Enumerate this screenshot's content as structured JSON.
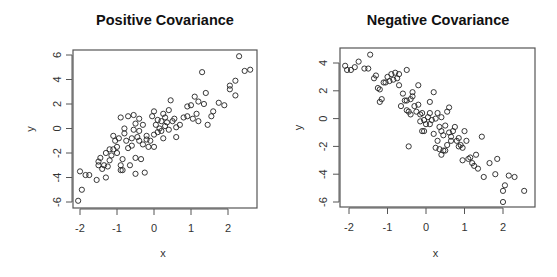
{
  "chart_data": [
    {
      "type": "scatter",
      "title": "Positive Covariance",
      "xlabel": "x",
      "ylabel": "y",
      "xlim": [
        -2.1,
        2.7
      ],
      "ylim": [
        -6.3,
        6.3
      ],
      "x_ticks": [
        -2,
        -1,
        0,
        1,
        2
      ],
      "y_ticks": [
        -6,
        -4,
        -2,
        0,
        2,
        4,
        6
      ],
      "grid": false,
      "legend": null,
      "marker": "open-circle",
      "points": [
        [
          -2.05,
          -5.9
        ],
        [
          -1.95,
          -5.0
        ],
        [
          -2.0,
          -3.5
        ],
        [
          -1.85,
          -3.8
        ],
        [
          -1.75,
          -3.8
        ],
        [
          -1.55,
          -4.2
        ],
        [
          -1.5,
          -3.0
        ],
        [
          -1.45,
          -2.4
        ],
        [
          -1.4,
          -3.3
        ],
        [
          -1.35,
          -3.0
        ],
        [
          -1.3,
          -2.0
        ],
        [
          -1.3,
          -4.0
        ],
        [
          -1.25,
          -3.1
        ],
        [
          -1.2,
          -2.6
        ],
        [
          -1.2,
          -1.7
        ],
        [
          -1.15,
          -2.2
        ],
        [
          -1.1,
          -1.7
        ],
        [
          -1.05,
          -1.0
        ],
        [
          -1.1,
          -0.6
        ],
        [
          -1.0,
          -1.5
        ],
        [
          -0.95,
          -0.8
        ],
        [
          -0.9,
          -3.4
        ],
        [
          -0.9,
          -3.0
        ],
        [
          -0.85,
          -3.4
        ],
        [
          -0.85,
          -2.5
        ],
        [
          -0.8,
          -0.4
        ],
        [
          -0.8,
          0.0
        ],
        [
          -0.75,
          -1.0
        ],
        [
          -0.7,
          -1.6
        ],
        [
          -0.65,
          -3.0
        ],
        [
          -0.6,
          -0.8
        ],
        [
          -0.55,
          -0.1
        ],
        [
          -0.5,
          -3.7
        ],
        [
          -0.5,
          -2.4
        ],
        [
          -0.5,
          0.4
        ],
        [
          -0.45,
          -0.7
        ],
        [
          -0.4,
          -0.2
        ],
        [
          -0.4,
          -1.0
        ],
        [
          -0.35,
          -2.5
        ],
        [
          -0.3,
          -1.3
        ],
        [
          -0.25,
          -3.6
        ],
        [
          -0.2,
          -0.9
        ],
        [
          -0.15,
          -1.5
        ],
        [
          -0.1,
          -1.0
        ],
        [
          -0.05,
          1.0
        ],
        [
          0.0,
          -0.5
        ],
        [
          0.0,
          -1.5
        ],
        [
          0.05,
          0.3
        ],
        [
          0.1,
          0.7
        ],
        [
          0.1,
          -0.3
        ],
        [
          0.15,
          0.0
        ],
        [
          0.2,
          0.6
        ],
        [
          0.2,
          -0.2
        ],
        [
          0.25,
          1.2
        ],
        [
          0.3,
          0.9
        ],
        [
          0.3,
          0.2
        ],
        [
          0.35,
          0.5
        ],
        [
          0.4,
          -0.1
        ],
        [
          0.4,
          1.5
        ],
        [
          0.45,
          2.3
        ],
        [
          0.5,
          0.6
        ],
        [
          0.55,
          0.8
        ],
        [
          0.6,
          0.1
        ],
        [
          0.6,
          -0.7
        ],
        [
          -0.9,
          0.9
        ],
        [
          -0.7,
          1.0
        ],
        [
          -0.55,
          1.1
        ],
        [
          -0.4,
          0.8
        ],
        [
          -0.2,
          -0.6
        ],
        [
          0.0,
          1.4
        ],
        [
          0.9,
          1.8
        ],
        [
          0.9,
          1.0
        ],
        [
          1.0,
          1.9
        ],
        [
          1.05,
          0.8
        ],
        [
          1.1,
          2.6
        ],
        [
          1.15,
          1.2
        ],
        [
          1.2,
          0.6
        ],
        [
          1.2,
          2.2
        ],
        [
          1.3,
          4.6
        ],
        [
          1.35,
          2.0
        ],
        [
          1.4,
          2.9
        ],
        [
          1.45,
          0.3
        ],
        [
          1.55,
          1.0
        ],
        [
          1.6,
          1.4
        ],
        [
          1.75,
          2.1
        ],
        [
          1.9,
          1.9
        ],
        [
          2.05,
          3.2
        ],
        [
          2.05,
          3.5
        ],
        [
          2.2,
          3.9
        ],
        [
          2.2,
          2.7
        ],
        [
          2.3,
          5.9
        ],
        [
          2.45,
          4.7
        ],
        [
          2.6,
          4.8
        ],
        [
          -0.3,
          0.3
        ],
        [
          0.25,
          -0.8
        ],
        [
          -1.0,
          -2.0
        ],
        [
          -0.6,
          -1.4
        ],
        [
          0.7,
          0.3
        ],
        [
          0.8,
          0.9
        ],
        [
          -1.5,
          -2.7
        ]
      ]
    },
    {
      "type": "scatter",
      "title": "Negative Covariance",
      "xlabel": "x",
      "ylabel": "y",
      "xlim": [
        -2.2,
        2.8
      ],
      "ylim": [
        -6.3,
        4.9
      ],
      "x_ticks": [
        -2,
        -1,
        0,
        1,
        2
      ],
      "y_ticks": [
        -6,
        -4,
        -2,
        0,
        2,
        4
      ],
      "grid": false,
      "legend": null,
      "marker": "open-circle",
      "points": [
        [
          -2.1,
          3.8
        ],
        [
          -2.05,
          3.5
        ],
        [
          -1.95,
          3.5
        ],
        [
          -1.85,
          3.7
        ],
        [
          -1.75,
          4.1
        ],
        [
          -1.6,
          3.6
        ],
        [
          -1.45,
          4.6
        ],
        [
          -1.5,
          3.6
        ],
        [
          -1.35,
          2.9
        ],
        [
          -1.3,
          3.1
        ],
        [
          -1.25,
          2.2
        ],
        [
          -1.2,
          2.1
        ],
        [
          -1.2,
          1.2
        ],
        [
          -1.15,
          1.4
        ],
        [
          -1.1,
          2.6
        ],
        [
          -1.05,
          2.6
        ],
        [
          -1.0,
          3.0
        ],
        [
          -0.95,
          2.7
        ],
        [
          -0.9,
          3.2
        ],
        [
          -0.85,
          2.8
        ],
        [
          -0.8,
          3.3
        ],
        [
          -0.75,
          2.9
        ],
        [
          -0.7,
          2.4
        ],
        [
          -0.7,
          3.2
        ],
        [
          -0.65,
          0.9
        ],
        [
          -0.6,
          1.8
        ],
        [
          -0.55,
          1.3
        ],
        [
          -0.5,
          3.5
        ],
        [
          -0.5,
          1.3
        ],
        [
          -0.45,
          0.5
        ],
        [
          -0.4,
          0.3
        ],
        [
          -0.35,
          1.9
        ],
        [
          -0.3,
          0.9
        ],
        [
          -0.25,
          0.5
        ],
        [
          -0.2,
          2.4
        ],
        [
          -0.2,
          1.0
        ],
        [
          -0.15,
          0.3
        ],
        [
          -0.1,
          0.4
        ],
        [
          -0.05,
          -0.1
        ],
        [
          0.0,
          -0.4
        ],
        [
          -0.4,
          1.4
        ],
        [
          -0.5,
          0.6
        ],
        [
          -0.35,
          1.6
        ],
        [
          -0.15,
          -0.2
        ],
        [
          0.05,
          0.1
        ],
        [
          0.1,
          1.2
        ],
        [
          0.1,
          0.4
        ],
        [
          0.15,
          -0.1
        ],
        [
          0.2,
          1.9
        ],
        [
          0.25,
          0.0
        ],
        [
          0.3,
          0.4
        ],
        [
          0.35,
          -0.6
        ],
        [
          0.4,
          0.1
        ],
        [
          0.4,
          -0.9
        ],
        [
          0.45,
          -1.2
        ],
        [
          0.5,
          -0.5
        ],
        [
          0.55,
          0.5
        ],
        [
          0.6,
          0.8
        ],
        [
          0.6,
          -1.0
        ],
        [
          0.65,
          -1.3
        ],
        [
          0.7,
          -0.9
        ],
        [
          0.75,
          -0.6
        ],
        [
          0.8,
          -1.6
        ],
        [
          0.85,
          -1.4
        ],
        [
          -0.45,
          -2.0
        ],
        [
          -0.1,
          -0.9
        ],
        [
          -0.05,
          -0.9
        ],
        [
          0.2,
          -1.1
        ],
        [
          0.25,
          -2.1
        ],
        [
          0.35,
          -2.2
        ],
        [
          0.4,
          -2.6
        ],
        [
          0.45,
          -2.3
        ],
        [
          0.5,
          -2.3
        ],
        [
          0.55,
          -1.9
        ],
        [
          0.65,
          -1.6
        ],
        [
          0.85,
          -2.0
        ],
        [
          0.9,
          -1.9
        ],
        [
          0.95,
          -2.1
        ],
        [
          0.95,
          -3.0
        ],
        [
          1.05,
          -1.6
        ],
        [
          1.1,
          -2.9
        ],
        [
          1.15,
          -2.8
        ],
        [
          1.2,
          -3.2
        ],
        [
          1.25,
          -3.4
        ],
        [
          1.3,
          -2.6
        ],
        [
          1.35,
          -3.6
        ],
        [
          1.45,
          -1.3
        ],
        [
          1.5,
          -4.2
        ],
        [
          1.65,
          -3.2
        ],
        [
          1.8,
          -4.0
        ],
        [
          1.85,
          -2.9
        ],
        [
          2.0,
          -5.2
        ],
        [
          2.05,
          -4.8
        ],
        [
          2.15,
          -4.1
        ],
        [
          2.3,
          -4.2
        ],
        [
          2.55,
          -5.2
        ],
        [
          2.0,
          -6.0
        ],
        [
          1.0,
          -0.9
        ],
        [
          0.3,
          -1.6
        ],
        [
          0.1,
          -0.4
        ]
      ]
    }
  ]
}
